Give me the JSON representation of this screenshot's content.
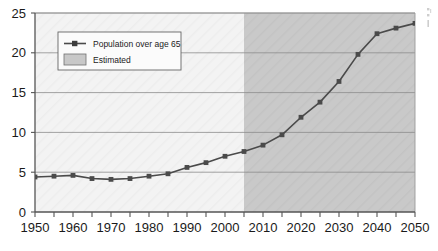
{
  "chart_data": {
    "type": "line",
    "title": "",
    "xlabel": "",
    "ylabel": "",
    "xlim": [
      1950,
      2050
    ],
    "ylim": [
      0,
      25
    ],
    "grid": true,
    "grid_axis": "y",
    "legend_position": "upper-left-inside",
    "x": [
      1950,
      1955,
      1960,
      1965,
      1970,
      1975,
      1980,
      1985,
      1990,
      1995,
      2000,
      2005,
      2010,
      2015,
      2020,
      2025,
      2030,
      2035,
      2040,
      2045,
      2050
    ],
    "series": [
      {
        "name": "Population over age 65",
        "marker": "square",
        "color": "#4a4a4a",
        "values": [
          4.4,
          4.5,
          4.6,
          4.2,
          4.1,
          4.2,
          4.5,
          4.8,
          5.6,
          6.2,
          7.0,
          7.6,
          8.4,
          9.7,
          11.9,
          13.8,
          16.4,
          19.8,
          22.4,
          23.1,
          23.7
        ]
      }
    ],
    "yticks": [
      0,
      5,
      10,
      15,
      20,
      25
    ],
    "ytick_labels": [
      "0",
      "5",
      "10",
      "15",
      "20",
      "25"
    ],
    "xticks": [
      1950,
      1955,
      1960,
      1965,
      1970,
      1975,
      1980,
      1985,
      1990,
      1995,
      2000,
      2005,
      2010,
      2015,
      2020,
      2025,
      2030,
      2035,
      2040,
      2045,
      2050
    ],
    "xtick_labels_major": [
      "1950",
      "1960",
      "1970",
      "1980",
      "1990",
      "2000",
      "2010",
      "2020",
      "2030",
      "2040",
      "2050"
    ],
    "xticks_major": [
      1950,
      1960,
      1970,
      1980,
      1990,
      2000,
      2010,
      2020,
      2030,
      2040,
      2050
    ],
    "shaded_region": {
      "name": "Estimated",
      "from": 2005,
      "to": 2050,
      "color": "#c8c8c8"
    },
    "plot_background": "#f2f2f2",
    "annotations": []
  },
  "legend": {
    "entries": [
      {
        "label": "Population over age 65",
        "type": "line-marker",
        "color": "#4a4a4a"
      },
      {
        "label": "Estimated",
        "type": "swatch",
        "color": "#c8c8c8"
      }
    ]
  },
  "edge": {
    "artifact_text": ""
  },
  "colors": {
    "axis": "#555555",
    "gridline": "#8c8c8c",
    "series": "#4a4a4a",
    "estimated_band": "#c8c8c8",
    "plot_bg": "#f2f2f2",
    "page_bg": "#ffffff",
    "tick_label": "#1a1a1a"
  }
}
